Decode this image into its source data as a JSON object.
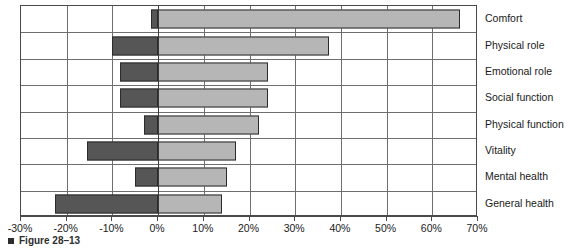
{
  "figure": {
    "caption": "Figure 28–13",
    "bullet_icon": "square-bullet-icon"
  },
  "chart_data": {
    "type": "bar",
    "orientation": "horizontal",
    "title": "",
    "subtitle": "",
    "xlabel": "",
    "ylabel": "",
    "xlim": [
      -30,
      70
    ],
    "xtick_labels": [
      "-30%",
      "-20%",
      "-10%",
      "0%",
      "10%",
      "20%",
      "30%",
      "40%",
      "50%",
      "60%",
      "70%"
    ],
    "xtick_values": [
      -30,
      -20,
      -10,
      0,
      10,
      20,
      30,
      40,
      50,
      60,
      70
    ],
    "grid": true,
    "legend": "none",
    "zero_reference": 0,
    "categories": [
      "Comfort",
      "Physical role",
      "Emotional role",
      "Social function",
      "Physical function",
      "Vitality",
      "Mental health",
      "General health"
    ],
    "series": [
      {
        "name": "Negative change",
        "color": "#565656",
        "values": [
          -1.5,
          -10.0,
          -8.3,
          -8.3,
          -3.0,
          -15.5,
          -5.0,
          -22.5
        ]
      },
      {
        "name": "Positive change",
        "color": "#b6b6b6",
        "values": [
          66.0,
          37.5,
          24.0,
          24.0,
          22.0,
          17.0,
          15.0,
          14.0
        ]
      }
    ],
    "colors": {
      "negative_bar": "#565656",
      "positive_bar": "#b6b6b6",
      "bar_outline": "#2b2b2b",
      "grid_line": "#6f6f6f",
      "axis_line": "#4a4a4a",
      "text": "#1a1a1a",
      "background": "#ffffff"
    }
  }
}
